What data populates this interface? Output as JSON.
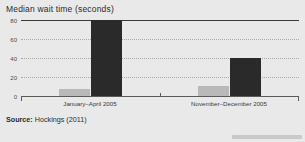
{
  "figure": {
    "background_color": "#e9e9e9",
    "title": "Median wait time (seconds)",
    "source_label": "Source:",
    "source_text": " Hockings (2011)"
  },
  "chart_data": {
    "type": "bar",
    "title": "Median wait time (seconds)",
    "xlabel": "",
    "ylabel": "Median wait time (seconds)",
    "ylim": [
      0,
      80
    ],
    "yticks": [
      0,
      20,
      40,
      60,
      80
    ],
    "grid": true,
    "grid_style": "dotted horizontal",
    "legend": "none",
    "categories": [
      "January–April 2005",
      "November–December 2005"
    ],
    "series": [
      {
        "name": "light",
        "color": "#b9b9b9",
        "values": [
          7,
          11
        ]
      },
      {
        "name": "dark",
        "color": "#2a2a2a",
        "values": [
          80,
          40
        ]
      }
    ],
    "annotations": [
      "Source: Hockings (2011)"
    ]
  },
  "axis": {
    "ticks": [
      {
        "label": "80",
        "value": 80
      },
      {
        "label": "60",
        "value": 60
      },
      {
        "label": "40",
        "value": 40
      },
      {
        "label": "20",
        "value": 20
      },
      {
        "label": "0",
        "value": 0
      }
    ]
  }
}
